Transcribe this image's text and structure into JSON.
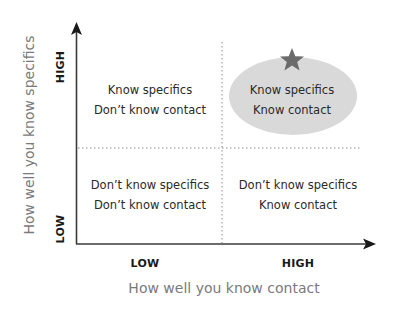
{
  "diagram": {
    "type": "2x2 quadrant matrix",
    "x_axis": {
      "label": "How well you know contact",
      "low": "LOW",
      "high": "HIGH"
    },
    "y_axis": {
      "label": "How well you know specifics",
      "low": "LOW",
      "high": "HIGH"
    },
    "quadrants": {
      "top_left": {
        "line1": "Know specifics",
        "line2": "Don’t know contact"
      },
      "top_right": {
        "line1": "Know specifics",
        "line2": "Know contact",
        "highlighted": true,
        "marker": "star-icon"
      },
      "bottom_left": {
        "line1": "Don’t know specifics",
        "line2": "Don’t know contact"
      },
      "bottom_right": {
        "line1": "Don’t know specifics",
        "line2": "Know contact"
      }
    },
    "colors": {
      "axis": "#3a3a3a",
      "divider": "#8a8a8a",
      "highlight_fill": "#d9d9d9",
      "star": "#6b6b6b",
      "axis_label": "#7a7a7a"
    }
  }
}
